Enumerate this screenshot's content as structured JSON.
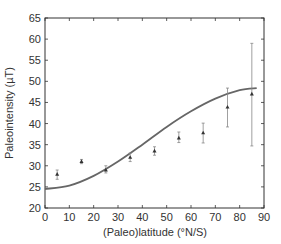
{
  "chart_data": {
    "type": "scatter",
    "title": "",
    "xlabel": "(Paleo)latitude (°N/S)",
    "ylabel": "Paleointensity (µT)",
    "xlim": [
      0,
      90
    ],
    "ylim": [
      20,
      65
    ],
    "xticks": [
      0,
      10,
      20,
      30,
      40,
      50,
      60,
      70,
      80,
      90
    ],
    "yticks": [
      20,
      25,
      30,
      35,
      40,
      45,
      50,
      55,
      60,
      65
    ],
    "grid": false,
    "legend": null,
    "series": [
      {
        "name": "Paleointensity data (with error bars)",
        "type": "scatter",
        "x": [
          5,
          15,
          25,
          35,
          45,
          55,
          65,
          75,
          85
        ],
        "y": [
          28,
          31,
          29,
          32,
          33.5,
          36.6,
          37.8,
          43.9,
          47
        ],
        "err_low": [
          26.8,
          30.5,
          28.3,
          31,
          32.5,
          35.5,
          35.4,
          39.2,
          34.7
        ],
        "err_high": [
          29,
          31.5,
          30,
          33,
          34.5,
          38,
          40.1,
          48.4,
          59
        ]
      },
      {
        "name": "Model curve",
        "type": "line",
        "x": [
          0,
          10,
          20,
          30,
          40,
          50,
          60,
          70,
          80,
          87
        ],
        "y": [
          24.5,
          25.3,
          27.6,
          31,
          35,
          39.2,
          42.9,
          45.9,
          47.9,
          48.4
        ]
      }
    ],
    "colors": {
      "curve": "#666666",
      "points": "#333333",
      "axis": "#333333"
    }
  }
}
